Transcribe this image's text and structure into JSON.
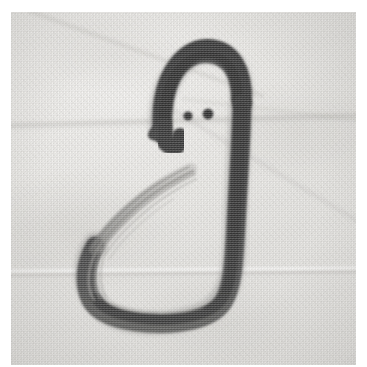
{
  "artwork": {
    "title": "Brush-ink bird figure",
    "subject_name": "stylised bird / duck drawn in one continuous brush stroke",
    "medium": "black ink brush painting photographed on folded woven cloth",
    "caption_text": "",
    "alt_text": "A black ink brush drawing of a bird-like figure with an arched head, two round dot eyes, a small pointed beak at the left, a long thick body stroke curving down the right side and around the bottom, and a lighter dry-brush wing stroke sweeping up from the lower left."
  },
  "photo": {
    "frame_name": "photographic-print",
    "margin_color": "#ffffff",
    "print_width": 345,
    "print_height": 353,
    "print_left": 11,
    "print_top": 12
  },
  "colors": {
    "page_white": "#ffffff",
    "cloth_light": "#f4f3f1",
    "cloth_mid": "#ebeae7",
    "cloth_shadow": "#dedddA",
    "ink_dark": "#3a3a3a",
    "ink_core": "#2e2e2e",
    "ink_mid": "#5b5b5b",
    "ink_dry": "#8d8d8b",
    "ink_faint": "#b6b5b2",
    "crease_gray": "#a6a4a0"
  },
  "ink_strokes": [
    {
      "id": "head-arch",
      "label": "head arch stroke",
      "description": "thick arched stroke forming the top of the head, opening downward"
    },
    {
      "id": "body-stroke",
      "label": "body stroke",
      "description": "long heavy stroke running from the head down the right side and sweeping around the bottom to the left"
    },
    {
      "id": "beak",
      "label": "beak",
      "description": "small pointed wedge of ink at the lower-left of the head"
    },
    {
      "id": "wing-stroke",
      "label": "wing dry-brush stroke",
      "description": "light streaky dry-brush stroke rising from the bottom-left curve toward the upper right"
    },
    {
      "id": "eye-left",
      "label": "left eye dot",
      "description": "small solid round ink dot"
    },
    {
      "id": "eye-right",
      "label": "right eye dot",
      "description": "small solid round ink dot, slightly larger than the left"
    }
  ],
  "geometry": {
    "eye_left": {
      "cx": 177,
      "cy": 104,
      "r": 4.6
    },
    "eye_right": {
      "cx": 197,
      "cy": 102,
      "r": 5.4
    },
    "head_top_y": 34,
    "body_bottom_y": 312,
    "body_right_x": 228,
    "body_left_x": 80
  },
  "creases": [
    {
      "id": "crease-upper",
      "orientation": "horizontal",
      "position_y": 104
    },
    {
      "id": "crease-lower",
      "orientation": "horizontal",
      "position_y": 256
    },
    {
      "id": "crease-diagonal-upper-left",
      "orientation": "diagonal",
      "angle_deg": 20
    },
    {
      "id": "crease-diagonal-right",
      "orientation": "diagonal",
      "angle_deg": 31
    },
    {
      "id": "crease-diagonal-top",
      "orientation": "diagonal",
      "angle_deg": 7
    }
  ]
}
